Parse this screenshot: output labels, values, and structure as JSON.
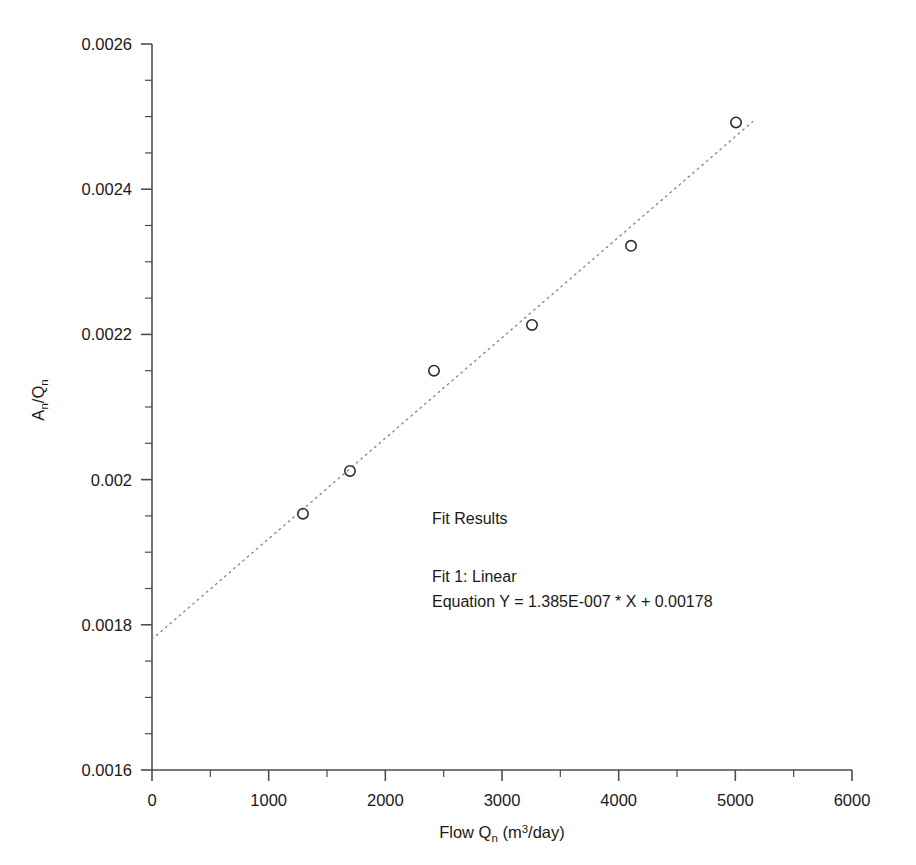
{
  "chart_data": {
    "type": "scatter",
    "title": "",
    "xlabel": "Flow Qn  (m3/day)",
    "ylabel": "An/Qn",
    "xlim": [
      0,
      6000
    ],
    "ylim": [
      0.0016,
      0.0026
    ],
    "grid": false,
    "legend": "none",
    "x_ticks": [
      0,
      1000,
      2000,
      3000,
      4000,
      5000,
      6000
    ],
    "x_tick_labels": [
      "0",
      "1000",
      "2000",
      "3000",
      "4000",
      "5000",
      "6000"
    ],
    "x_minor_step": 500,
    "y_ticks": [
      0.0016,
      0.0018,
      0.002,
      0.0022,
      0.0024,
      0.0026
    ],
    "y_tick_labels": [
      "0.0016",
      "0.0018",
      "0.002",
      "0.0022",
      "0.0024",
      "0.0026"
    ],
    "y_minor_step": 5e-05,
    "marker": "open-circle",
    "series": [
      {
        "name": "An/Qn data",
        "x": [
          1294,
          1697,
          2417,
          3257,
          4106,
          5006
        ],
        "y": [
          0.001953,
          0.002012,
          0.00215,
          0.002213,
          0.002322,
          0.002492
        ]
      }
    ],
    "fit": {
      "name": "Fit 1: Linear",
      "style": "dotted",
      "slope": 1.385e-07,
      "intercept": 0.00178,
      "x_start": 0,
      "x_end": 5150
    },
    "annotations": {
      "heading": "Fit Results",
      "fit_name": "Fit 1: Linear",
      "equation": "Equation Y = 1.385E-007 * X + 0.00178"
    }
  },
  "axis_labels": {
    "y_main": "A",
    "y_sub1": "n",
    "y_slash": "/Q",
    "y_sub2": "n",
    "x_main": "Flow Q",
    "x_sub1": "n",
    "x_unit_open": "  (m",
    "x_unit_sup": "3",
    "x_unit_close": "/day)"
  }
}
